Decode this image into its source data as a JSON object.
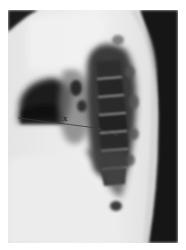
{
  "figure": {
    "type": "lateral chest radiograph",
    "measurement": {
      "label": "x",
      "line_start": [
        18,
        118
      ],
      "line_end": [
        97,
        128
      ],
      "tick_x": 97,
      "tick_y_range": [
        117,
        138
      ]
    },
    "colors": {
      "background": "#ffffff",
      "soft_tissue": "#e8e8e8",
      "air_dark": "#141414",
      "annotation_line": "#3a3a3a"
    }
  }
}
